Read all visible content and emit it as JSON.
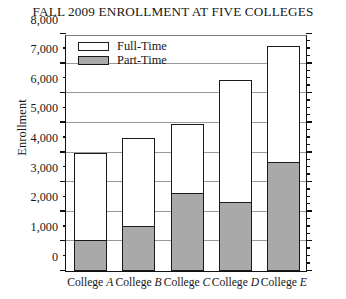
{
  "chart_data": {
    "type": "bar",
    "title": "FALL 2009 ENROLLMENT AT FIVE COLLEGES",
    "xlabel": "",
    "ylabel": "Enrollment",
    "ylim": [
      0,
      8000
    ],
    "ytick_step": 1000,
    "yminor_step": 500,
    "grid": true,
    "stacked": true,
    "legend_position": "top-left inside plot",
    "categories": [
      "College A",
      "College B",
      "College C",
      "College D",
      "College E"
    ],
    "category_prefix": "College",
    "category_letters": [
      "A",
      "B",
      "C",
      "D",
      "E"
    ],
    "series": [
      {
        "name": "Part-Time",
        "color": "#a9a9a9",
        "values": [
          1000,
          1500,
          2600,
          2300,
          3650
        ]
      },
      {
        "name": "Full-Time",
        "color": "#ffffff",
        "values": [
          3000,
          3000,
          2350,
          4150,
          3950
        ]
      }
    ],
    "totals": [
      4000,
      4500,
      4950,
      6450,
      7600
    ],
    "ytick_labels": [
      "0",
      "1,000",
      "2,000",
      "3,000",
      "4,000",
      "5,000",
      "6,000",
      "7,000",
      "8,000"
    ],
    "ytick_values": [
      0,
      1000,
      2000,
      3000,
      4000,
      5000,
      6000,
      7000,
      8000
    ]
  },
  "legend": {
    "items": [
      {
        "label": "Full-Time",
        "swatch": "full"
      },
      {
        "label": "Part-Time",
        "swatch": "part"
      }
    ]
  }
}
